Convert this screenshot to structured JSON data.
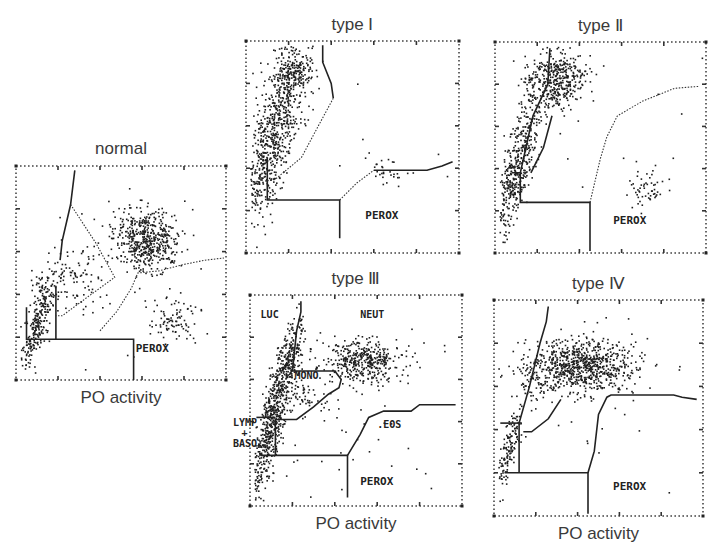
{
  "figure": {
    "x_axis_label": "PO activity",
    "panels": [
      {
        "id": "normal",
        "title": "normal",
        "show_xlabel": true,
        "frame": {
          "x": 16,
          "y": 166,
          "w": 210,
          "h": 214
        },
        "region_labels": [
          {
            "text": "PEROX",
            "x": 0.57,
            "y": 0.87
          }
        ],
        "gates": [
          {
            "style": "solid",
            "pts": [
              [
                0.28,
                0.02
              ],
              [
                0.26,
                0.18
              ],
              [
                0.22,
                0.35
              ],
              [
                0.21,
                0.44
              ]
            ]
          },
          {
            "style": "solid",
            "pts": [
              [
                0.05,
                0.66
              ],
              [
                0.05,
                0.81
              ],
              [
                0.56,
                0.81
              ],
              [
                0.56,
                1.0
              ]
            ]
          },
          {
            "style": "solid",
            "pts": [
              [
                0.19,
                0.56
              ],
              [
                0.19,
                0.81
              ]
            ]
          },
          {
            "style": "dotted",
            "pts": [
              [
                0.26,
                0.18
              ],
              [
                0.38,
                0.36
              ],
              [
                0.47,
                0.52
              ],
              [
                0.33,
                0.62
              ],
              [
                0.22,
                0.7
              ],
              [
                0.19,
                0.7
              ]
            ]
          },
          {
            "style": "dotted",
            "pts": [
              [
                0.4,
                0.77
              ],
              [
                0.48,
                0.68
              ],
              [
                0.55,
                0.57
              ],
              [
                0.58,
                0.5
              ],
              [
                0.68,
                0.49
              ],
              [
                0.8,
                0.46
              ],
              [
                0.9,
                0.44
              ],
              [
                0.99,
                0.43
              ]
            ]
          }
        ],
        "clusters": [
          {
            "name": "neut",
            "cx": 0.62,
            "cy": 0.34,
            "sx": 0.08,
            "sy": 0.07,
            "n": 520
          },
          {
            "name": "lymph",
            "cx": 0.1,
            "cy": 0.72,
            "sx": 0.025,
            "sy": 0.12,
            "n": 260
          },
          {
            "name": "diag",
            "cx": 0.25,
            "cy": 0.52,
            "sx": 0.08,
            "sy": 0.08,
            "n": 110
          },
          {
            "name": "eos",
            "cx": 0.75,
            "cy": 0.72,
            "sx": 0.06,
            "sy": 0.05,
            "n": 90
          },
          {
            "name": "sparse",
            "cx": 0.5,
            "cy": 0.5,
            "sx": 0.25,
            "sy": 0.25,
            "n": 30
          }
        ]
      },
      {
        "id": "type-1",
        "title": "type Ⅰ",
        "show_xlabel": false,
        "frame": {
          "x": 246,
          "y": 41,
          "w": 213,
          "h": 212
        },
        "region_labels": [
          {
            "text": "PEROX",
            "x": 0.56,
            "y": 0.84
          }
        ],
        "gates": [
          {
            "style": "solid",
            "pts": [
              [
                0.1,
                0.55
              ],
              [
                0.1,
                0.75
              ],
              [
                0.44,
                0.75
              ],
              [
                0.44,
                0.93
              ]
            ]
          },
          {
            "style": "solid",
            "pts": [
              [
                0.36,
                0.02
              ],
              [
                0.36,
                0.1
              ],
              [
                0.4,
                0.2
              ],
              [
                0.41,
                0.27
              ]
            ]
          },
          {
            "style": "dotted",
            "pts": [
              [
                0.41,
                0.27
              ],
              [
                0.34,
                0.4
              ],
              [
                0.26,
                0.55
              ],
              [
                0.14,
                0.65
              ],
              [
                0.1,
                0.66
              ]
            ]
          },
          {
            "style": "solid",
            "pts": [
              [
                0.6,
                0.61
              ],
              [
                0.85,
                0.61
              ],
              [
                0.92,
                0.59
              ],
              [
                0.97,
                0.57
              ]
            ]
          },
          {
            "style": "dotted",
            "pts": [
              [
                0.44,
                0.75
              ],
              [
                0.52,
                0.67
              ],
              [
                0.6,
                0.61
              ]
            ]
          }
        ],
        "clusters": [
          {
            "name": "lymph",
            "cx": 0.12,
            "cy": 0.45,
            "sx": 0.05,
            "sy": 0.2,
            "n": 700
          },
          {
            "name": "top",
            "cx": 0.22,
            "cy": 0.15,
            "sx": 0.05,
            "sy": 0.07,
            "n": 220
          },
          {
            "name": "eos",
            "cx": 0.65,
            "cy": 0.62,
            "sx": 0.05,
            "sy": 0.04,
            "n": 30
          },
          {
            "name": "sparse",
            "cx": 0.5,
            "cy": 0.45,
            "sx": 0.25,
            "sy": 0.25,
            "n": 8
          }
        ]
      },
      {
        "id": "type-2",
        "title": "type Ⅱ",
        "show_xlabel": false,
        "frame": {
          "x": 495,
          "y": 42,
          "w": 211,
          "h": 211
        },
        "region_labels": [
          {
            "text": "PEROX",
            "x": 0.56,
            "y": 0.86
          }
        ],
        "gates": [
          {
            "style": "solid",
            "pts": [
              [
                0.08,
                0.62
              ],
              [
                0.12,
                0.62
              ],
              [
                0.12,
                0.76
              ],
              [
                0.45,
                0.76
              ],
              [
                0.45,
                0.99
              ]
            ]
          },
          {
            "style": "solid",
            "pts": [
              [
                0.26,
                0.03
              ],
              [
                0.25,
                0.2
              ],
              [
                0.18,
                0.35
              ],
              [
                0.12,
                0.62
              ]
            ]
          },
          {
            "style": "solid",
            "pts": [
              [
                0.27,
                0.35
              ],
              [
                0.23,
                0.5
              ],
              [
                0.17,
                0.62
              ]
            ]
          },
          {
            "style": "dotted",
            "pts": [
              [
                0.45,
                0.76
              ],
              [
                0.5,
                0.55
              ],
              [
                0.53,
                0.45
              ],
              [
                0.58,
                0.35
              ],
              [
                0.7,
                0.28
              ],
              [
                0.85,
                0.22
              ],
              [
                0.97,
                0.21
              ]
            ]
          }
        ],
        "clusters": [
          {
            "name": "mono",
            "cx": 0.28,
            "cy": 0.18,
            "sx": 0.07,
            "sy": 0.07,
            "n": 420
          },
          {
            "name": "lymph",
            "cx": 0.1,
            "cy": 0.6,
            "sx": 0.035,
            "sy": 0.18,
            "n": 480
          },
          {
            "name": "eos",
            "cx": 0.71,
            "cy": 0.68,
            "sx": 0.05,
            "sy": 0.05,
            "n": 55
          },
          {
            "name": "sparse",
            "cx": 0.6,
            "cy": 0.45,
            "sx": 0.25,
            "sy": 0.25,
            "n": 10
          }
        ]
      },
      {
        "id": "type-3",
        "title": "type Ⅲ",
        "show_xlabel": true,
        "frame": {
          "x": 250,
          "y": 295,
          "w": 212,
          "h": 211
        },
        "region_labels": [
          {
            "text": "LUC",
            "x": 0.05,
            "y": 0.11
          },
          {
            "text": "NEUT",
            "x": 0.52,
            "y": 0.11
          },
          {
            "text": "MONO",
            "x": 0.21,
            "y": 0.4
          },
          {
            "text": "LYMP",
            "x": -0.08,
            "y": 0.62
          },
          {
            "text": "+",
            "x": -0.04,
            "y": 0.67
          },
          {
            "text": "BASO",
            "x": -0.08,
            "y": 0.72
          },
          {
            "text": ".EOS",
            "x": 0.6,
            "y": 0.63
          },
          {
            "text": "PEROX",
            "x": 0.52,
            "y": 0.9
          }
        ],
        "gates": [
          {
            "style": "solid",
            "pts": [
              [
                0.24,
                0.03
              ],
              [
                0.24,
                0.08
              ],
              [
                0.22,
                0.17
              ],
              [
                0.2,
                0.36
              ]
            ]
          },
          {
            "style": "solid",
            "pts": [
              [
                0.2,
                0.36
              ],
              [
                0.4,
                0.36
              ],
              [
                0.43,
                0.4
              ],
              [
                0.42,
                0.44
              ],
              [
                0.37,
                0.47
              ],
              [
                0.3,
                0.53
              ],
              [
                0.22,
                0.59
              ],
              [
                0.12,
                0.59
              ],
              [
                0.12,
                0.76
              ]
            ]
          },
          {
            "style": "solid",
            "pts": [
              [
                0.03,
                0.58
              ],
              [
                0.12,
                0.58
              ]
            ]
          },
          {
            "style": "solid",
            "pts": [
              [
                0.05,
                0.76
              ],
              [
                0.46,
                0.76
              ],
              [
                0.46,
                0.96
              ]
            ]
          },
          {
            "style": "solid",
            "pts": [
              [
                0.46,
                0.76
              ],
              [
                0.52,
                0.66
              ],
              [
                0.56,
                0.58
              ],
              [
                0.63,
                0.55
              ],
              [
                0.76,
                0.55
              ],
              [
                0.8,
                0.52
              ],
              [
                0.9,
                0.52
              ],
              [
                0.97,
                0.52
              ]
            ]
          }
        ],
        "clusters": [
          {
            "name": "neut",
            "cx": 0.53,
            "cy": 0.31,
            "sx": 0.09,
            "sy": 0.05,
            "n": 420
          },
          {
            "name": "lymph",
            "cx": 0.1,
            "cy": 0.6,
            "sx": 0.03,
            "sy": 0.2,
            "n": 650
          },
          {
            "name": "luc",
            "cx": 0.17,
            "cy": 0.3,
            "sx": 0.03,
            "sy": 0.08,
            "n": 180
          },
          {
            "name": "mono",
            "cx": 0.25,
            "cy": 0.47,
            "sx": 0.06,
            "sy": 0.05,
            "n": 60
          },
          {
            "name": "sparse",
            "cx": 0.5,
            "cy": 0.6,
            "sx": 0.22,
            "sy": 0.18,
            "n": 45
          }
        ]
      },
      {
        "id": "type-4",
        "title": "type Ⅳ",
        "show_xlabel": true,
        "frame": {
          "x": 494,
          "y": 300,
          "w": 209,
          "h": 216
        },
        "region_labels": [
          {
            "text": "PEROX",
            "x": 0.57,
            "y": 0.88
          }
        ],
        "gates": [
          {
            "style": "solid",
            "pts": [
              [
                0.26,
                0.03
              ],
              [
                0.25,
                0.1
              ],
              [
                0.22,
                0.2
              ],
              [
                0.17,
                0.4
              ],
              [
                0.12,
                0.57
              ],
              [
                0.12,
                0.8
              ]
            ]
          },
          {
            "style": "solid",
            "pts": [
              [
                0.03,
                0.57
              ],
              [
                0.12,
                0.57
              ]
            ]
          },
          {
            "style": "solid",
            "pts": [
              [
                0.05,
                0.8
              ],
              [
                0.45,
                0.8
              ],
              [
                0.45,
                0.99
              ]
            ]
          },
          {
            "style": "solid",
            "pts": [
              [
                0.32,
                0.46
              ],
              [
                0.26,
                0.55
              ],
              [
                0.18,
                0.61
              ],
              [
                0.14,
                0.61
              ]
            ]
          },
          {
            "style": "solid",
            "pts": [
              [
                0.45,
                0.8
              ],
              [
                0.48,
                0.7
              ],
              [
                0.5,
                0.53
              ],
              [
                0.54,
                0.45
              ],
              [
                0.56,
                0.44
              ],
              [
                0.86,
                0.44
              ],
              [
                0.9,
                0.45
              ],
              [
                0.97,
                0.46
              ]
            ]
          }
        ],
        "clusters": [
          {
            "name": "neut",
            "cx": 0.42,
            "cy": 0.3,
            "sx": 0.13,
            "sy": 0.06,
            "n": 800
          },
          {
            "name": "lymph",
            "cx": 0.07,
            "cy": 0.68,
            "sx": 0.02,
            "sy": 0.1,
            "n": 150
          },
          {
            "name": "mono",
            "cx": 0.2,
            "cy": 0.38,
            "sx": 0.05,
            "sy": 0.05,
            "n": 60
          },
          {
            "name": "sparse",
            "cx": 0.5,
            "cy": 0.45,
            "sx": 0.25,
            "sy": 0.25,
            "n": 25
          }
        ]
      }
    ]
  },
  "chart_data": {
    "type": "scatter",
    "title": "",
    "xlabel": "PO activity",
    "ylabel": "",
    "panels": [
      {
        "title": "normal",
        "gate_labels": [
          "PEROX"
        ],
        "populations": [
          {
            "name": "NEUT",
            "x": 0.62,
            "y": 0.66,
            "density": "high"
          },
          {
            "name": "LYMP",
            "x": 0.1,
            "y": 0.28,
            "density": "high"
          },
          {
            "name": "EOS",
            "x": 0.75,
            "y": 0.28,
            "density": "moderate"
          }
        ]
      },
      {
        "title": "type I",
        "gate_labels": [
          "PEROX"
        ],
        "populations": [
          {
            "name": "LYMP/LUC",
            "x": 0.15,
            "y": 0.65,
            "density": "very high"
          },
          {
            "name": "EOS",
            "x": 0.65,
            "y": 0.38,
            "density": "low"
          }
        ]
      },
      {
        "title": "type II",
        "gate_labels": [
          "PEROX"
        ],
        "populations": [
          {
            "name": "MONO/LUC",
            "x": 0.28,
            "y": 0.82,
            "density": "high"
          },
          {
            "name": "LYMP",
            "x": 0.1,
            "y": 0.4,
            "density": "high"
          },
          {
            "name": "EOS",
            "x": 0.71,
            "y": 0.32,
            "density": "low"
          }
        ]
      },
      {
        "title": "type III",
        "gate_labels": [
          "LUC",
          "NEUT",
          "MONO",
          "LYMP + BASO",
          ".EOS",
          "PEROX"
        ],
        "populations": [
          {
            "name": "NEUT",
            "x": 0.53,
            "y": 0.69,
            "density": "high"
          },
          {
            "name": "LYMP",
            "x": 0.1,
            "y": 0.4,
            "density": "very high"
          },
          {
            "name": "LUC",
            "x": 0.17,
            "y": 0.7,
            "density": "moderate"
          }
        ]
      },
      {
        "title": "type IV",
        "gate_labels": [
          "PEROX"
        ],
        "populations": [
          {
            "name": "NEUT",
            "x": 0.42,
            "y": 0.7,
            "density": "very high"
          },
          {
            "name": "LYMP",
            "x": 0.07,
            "y": 0.32,
            "density": "low"
          }
        ]
      }
    ],
    "grid": false,
    "legend": "none"
  }
}
